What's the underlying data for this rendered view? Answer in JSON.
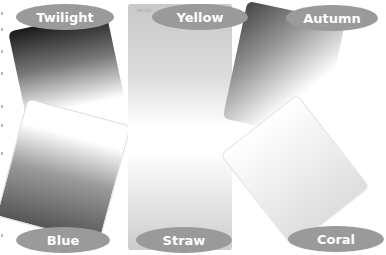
{
  "filters": [
    {
      "name": "Twilight",
      "label": "Twilight"
    },
    {
      "name": "Yellow",
      "label": "Yellow",
      "code": "HG 221"
    },
    {
      "name": "Autumn",
      "label": "Autumn"
    },
    {
      "name": "Blue",
      "label": "Blue"
    },
    {
      "name": "Straw",
      "label": "Straw"
    },
    {
      "name": "Coral",
      "label": "Coral"
    }
  ],
  "colors": {
    "label_bg": "#9a9a9a",
    "label_text": "#ffffff"
  }
}
